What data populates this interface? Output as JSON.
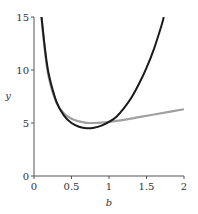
{
  "chart_data": {
    "type": "line",
    "title": "",
    "xlabel": "b",
    "ylabel": "y",
    "xlim": [
      0,
      2
    ],
    "ylim": [
      0,
      15
    ],
    "xticks": [
      0,
      0.5,
      1,
      1.5,
      2
    ],
    "xtick_labels": [
      "0",
      "0.5",
      "1",
      "1.5",
      "2"
    ],
    "yticks": [
      0,
      5,
      10,
      15
    ],
    "ytick_labels": [
      "0",
      "5",
      "10",
      "15"
    ],
    "grid": false,
    "legend": null,
    "series": [
      {
        "name": "gray-curve",
        "color": "#a0a0a0",
        "x": [
          0.1,
          0.15,
          0.2,
          0.3,
          0.4,
          0.5,
          0.6,
          0.7,
          0.8,
          0.9,
          1.0,
          1.2,
          1.4,
          1.6,
          1.8,
          2.0
        ],
        "y": [
          15.0,
          11.5,
          9.2,
          6.9,
          5.9,
          5.4,
          5.15,
          5.02,
          5.0,
          5.03,
          5.1,
          5.3,
          5.55,
          5.8,
          6.05,
          6.3
        ]
      },
      {
        "name": "black-curve",
        "color": "#1a1a1a",
        "x": [
          0.1,
          0.15,
          0.2,
          0.3,
          0.4,
          0.5,
          0.6,
          0.7,
          0.8,
          0.9,
          1.0,
          1.1,
          1.2,
          1.3,
          1.4,
          1.5,
          1.6,
          1.7,
          1.73
        ],
        "y": [
          15.0,
          11.8,
          9.5,
          7.0,
          5.7,
          5.0,
          4.65,
          4.5,
          4.55,
          4.75,
          5.1,
          5.6,
          6.4,
          7.4,
          8.7,
          10.2,
          12.0,
          14.2,
          15.0
        ]
      }
    ]
  }
}
